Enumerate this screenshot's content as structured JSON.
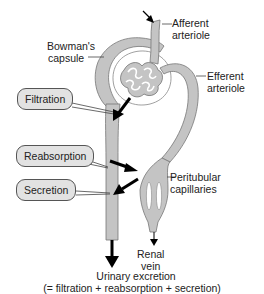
{
  "diagram": {
    "labels": {
      "bowmans_capsule": [
        "Bowman's",
        "capsule"
      ],
      "afferent_arteriole": [
        "Afferent",
        "arteriole"
      ],
      "efferent_arteriole": [
        "Efferent",
        "arteriole"
      ],
      "peritubular_capillaries": [
        "Peritubular",
        "capillaries"
      ],
      "renal_vein": [
        "Renal",
        "vein"
      ]
    },
    "callouts": {
      "filtration": "Filtration",
      "reabsorption": "Reabsorption",
      "secretion": "Secretion"
    },
    "footer": {
      "line1": "Urinary excretion",
      "line2": "(= filtration + reabsorption + secretion)"
    },
    "colors": {
      "tubule_fill": "#c4c4c4",
      "outline": "#666666",
      "arrow": "#000000",
      "callout_fill": "#e2e2e2"
    }
  }
}
